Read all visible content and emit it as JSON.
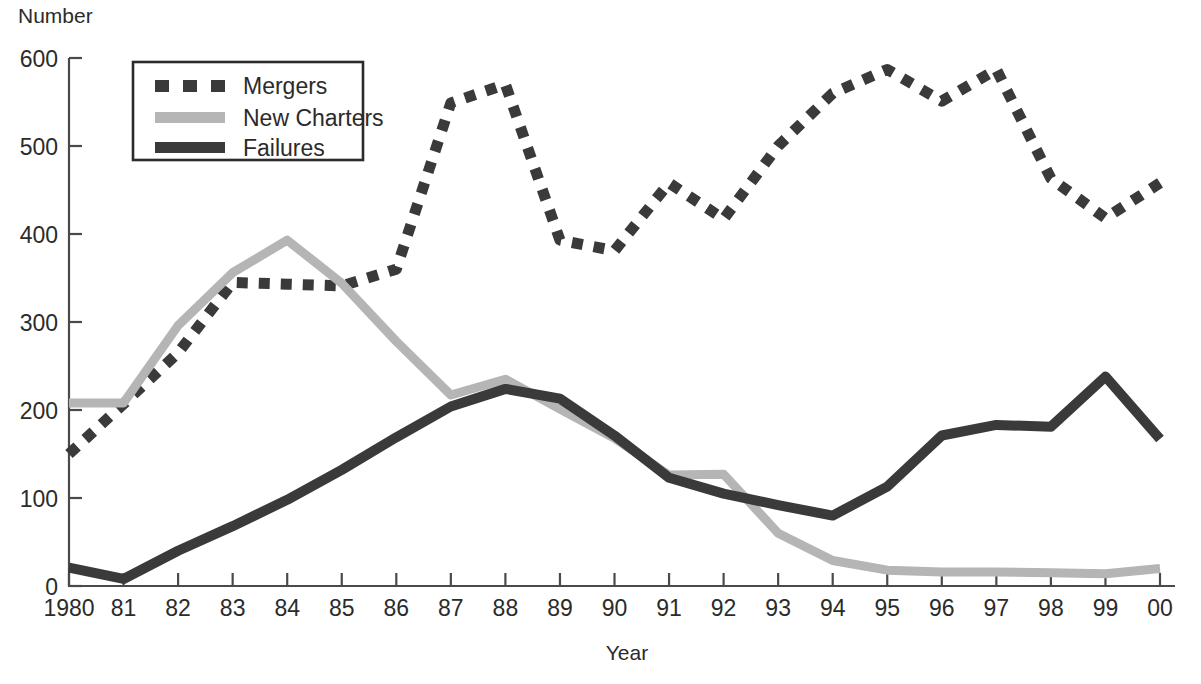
{
  "chart_data": {
    "type": "line",
    "title": "",
    "xlabel": "Year",
    "ylabel": "Number",
    "ylim": [
      0,
      600
    ],
    "ytick_step": 100,
    "grid": false,
    "legend_position": "top-left",
    "x": [
      1980,
      1981,
      1982,
      1983,
      1984,
      1985,
      1986,
      1987,
      1988,
      1989,
      1990,
      1991,
      1992,
      1993,
      1994,
      1995,
      1996,
      1997,
      1998,
      1999,
      2000
    ],
    "categories": [
      "1980",
      "81",
      "82",
      "83",
      "84",
      "85",
      "86",
      "87",
      "88",
      "89",
      "90",
      "91",
      "92",
      "93",
      "94",
      "95",
      "96",
      "97",
      "98",
      "99",
      "00"
    ],
    "yticks": [
      "0",
      "100",
      "200",
      "300",
      "400",
      "500",
      "600"
    ],
    "series": [
      {
        "name": "Mergers",
        "style": "dashed",
        "color": "#3a3a3a",
        "values": [
          150,
          207,
          265,
          345,
          343,
          341,
          360,
          549,
          570,
          393,
          381,
          458,
          417,
          500,
          560,
          587,
          551,
          587,
          463,
          418,
          458
        ]
      },
      {
        "name": "New Charters",
        "style": "solid-light",
        "color": "#b5b5b5",
        "values": [
          208,
          208,
          296,
          356,
          393,
          344,
          278,
          217,
          235,
          201,
          168,
          126,
          127,
          60,
          29,
          18,
          16,
          16,
          15,
          14,
          20
        ]
      },
      {
        "name": "Failures",
        "style": "solid-dark",
        "color": "#3a3a3a",
        "values": [
          21,
          8,
          40,
          68,
          98,
          132,
          169,
          204,
          224,
          213,
          171,
          123,
          105,
          92,
          80,
          113,
          171,
          183,
          181,
          238,
          167
        ]
      }
    ]
  },
  "axes": {
    "y_title": "Number",
    "x_title": "Year"
  },
  "legend": {
    "entries": [
      {
        "label": "Mergers",
        "swatch": "dashed-swatch"
      },
      {
        "label": "New Charters",
        "swatch": "light-line-swatch"
      },
      {
        "label": "Failures",
        "swatch": "dark-line-swatch"
      }
    ]
  },
  "colors": {
    "mergers": "#3a3a3a",
    "new_charters": "#b5b5b5",
    "failures": "#3a3a3a",
    "axis": "#4a4a4a",
    "text": "#2b2b2b",
    "background": "#ffffff"
  }
}
